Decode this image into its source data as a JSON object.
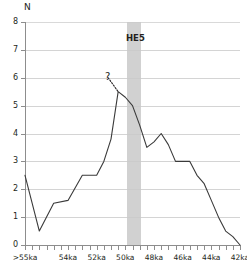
{
  "chart_data": {
    "type": "line",
    "title": "",
    "subtitle": "",
    "xlabel": "",
    "ylabel": "N",
    "x_axis_label_text": "",
    "y_axis_label_text": "N",
    "grid": true,
    "legend": "none",
    "xlim": [
      55,
      40
    ],
    "ylim": [
      0,
      8
    ],
    "x_tick_labels": [
      ">55ka",
      "54ka",
      "52ka",
      "50ka",
      "48ka",
      "46ka",
      "44ka",
      "42ka",
      "40ka"
    ],
    "x_tick_values": [
      55,
      54,
      52,
      50,
      48,
      46,
      44,
      42,
      40
    ],
    "x_minor_ticks": [
      55,
      54.5,
      54,
      53.5,
      53,
      52.5,
      52,
      51.5,
      51,
      50.5,
      50,
      49.5,
      49,
      48.5,
      48,
      47.5,
      47,
      46.5,
      46,
      45.5,
      45,
      44.5,
      44,
      43.5,
      43,
      42.5,
      42,
      41.5,
      41,
      40.5,
      40
    ],
    "y_tick_labels": [
      "0",
      "1",
      "2",
      "3",
      "4",
      "5",
      "6",
      "7",
      "8"
    ],
    "y_tick_values": [
      0,
      1,
      2,
      3,
      4,
      5,
      6,
      7,
      8
    ],
    "x": [
      55.0,
      54.0,
      53.0,
      52.0,
      51.0,
      50.5,
      50.0,
      49.5,
      49.0,
      48.5,
      48.0,
      47.5,
      47.0,
      46.5,
      46.0,
      45.5,
      45.0,
      44.5,
      44.0,
      43.5,
      43.0,
      42.5,
      42.0,
      41.5,
      41.0,
      40.5,
      40.0
    ],
    "values": [
      2.5,
      0.5,
      1.5,
      1.6,
      2.5,
      2.5,
      2.5,
      3.0,
      3.8,
      5.5,
      5.3,
      5.0,
      4.3,
      3.5,
      3.7,
      4.0,
      3.6,
      3.0,
      3.0,
      3.0,
      2.5,
      2.2,
      1.6,
      1.0,
      0.5,
      0.3,
      0.0
    ],
    "series": [
      {
        "name": "N",
        "color": "#3a3a3a",
        "x": [
          55.0,
          54.0,
          53.0,
          52.0,
          51.0,
          50.5,
          50.0,
          49.5,
          49.0,
          48.5,
          48.0,
          47.5,
          47.0,
          46.5,
          46.0,
          45.5,
          45.0,
          44.5,
          44.0,
          43.5,
          43.0,
          42.5,
          42.0,
          41.5,
          41.0,
          40.5,
          40.0
        ],
        "values": [
          2.5,
          0.5,
          1.5,
          1.6,
          2.5,
          2.5,
          2.5,
          3.0,
          3.8,
          5.5,
          5.3,
          5.0,
          4.3,
          3.5,
          3.7,
          4.0,
          3.6,
          3.0,
          3.0,
          3.0,
          2.5,
          2.2,
          1.6,
          1.0,
          0.5,
          0.3,
          0.0
        ]
      }
    ],
    "annotations": [
      {
        "name": "heinrich-event-band",
        "label": "HE5",
        "type": "vertical-band",
        "x_start": 48.35,
        "x_end": 47.1,
        "color": "#c9c9c9"
      },
      {
        "name": "uncertainty-marker",
        "label": "?",
        "type": "dotted-leader",
        "x": 49.2,
        "y": 6.0,
        "target_x": 48.5,
        "target_y": 5.5
      }
    ]
  },
  "axis": {
    "y_title": "N"
  },
  "band": {
    "label": "HE5"
  },
  "marker": {
    "question": "?"
  }
}
